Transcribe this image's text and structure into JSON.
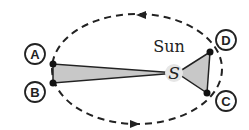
{
  "diagram": {
    "sun": {
      "label": "Sun",
      "symbol": "S"
    },
    "points": [
      {
        "id": "A",
        "label": "A"
      },
      {
        "id": "B",
        "label": "B"
      },
      {
        "id": "C",
        "label": "C"
      },
      {
        "id": "D",
        "label": "D"
      }
    ],
    "orbit": {
      "style": "dashed ellipse",
      "direction": "counterclockwise"
    },
    "colors": {
      "line": "#222222",
      "area": "#c8c8c8",
      "sun": "#e6e6e6"
    }
  }
}
